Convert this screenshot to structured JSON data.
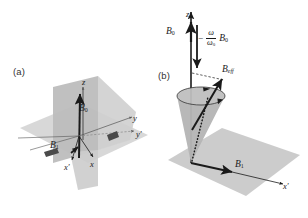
{
  "figure": {
    "background_color": "#ffffff",
    "ink_color": "#1a1a1a",
    "plane_fill_light": "#d9d9d9",
    "plane_fill_mid": "#c2c2c2",
    "plane_fill_dark": "#a8a8a8",
    "cone_fill": "#b5b5b5"
  },
  "panels": {
    "a": {
      "label": "(a)",
      "axes": [
        {
          "name": "z-axis",
          "label": "z"
        },
        {
          "name": "y-axis",
          "label": "y"
        },
        {
          "name": "y-prime-axis",
          "label": "y′"
        },
        {
          "name": "x-axis",
          "label": "x"
        },
        {
          "name": "x-prime-axis",
          "label": "x′"
        }
      ],
      "vectors": [
        {
          "name": "B0-vector",
          "symbol": "B",
          "subscript": "0"
        },
        {
          "name": "B1-vector",
          "symbol": "B",
          "subscript": "1"
        }
      ]
    },
    "b": {
      "label": "(b)",
      "axes": [
        {
          "name": "z-axis",
          "label": "z"
        },
        {
          "name": "x-prime-axis",
          "label": "x′"
        }
      ],
      "vectors": [
        {
          "name": "B0-vector",
          "symbol": "B",
          "subscript": "0"
        },
        {
          "name": "B1-vector",
          "symbol": "B",
          "subscript": "1"
        },
        {
          "name": "Beff-vector",
          "symbol": "B",
          "subscript": "eff"
        }
      ],
      "fraction_expression": {
        "name": "omega-ratio-B0",
        "sign": "−",
        "numerator": "ω",
        "denominator_symbol": "ω",
        "denominator_subscript": "0",
        "trailing_symbol": "B",
        "trailing_subscript": "0"
      }
    }
  }
}
